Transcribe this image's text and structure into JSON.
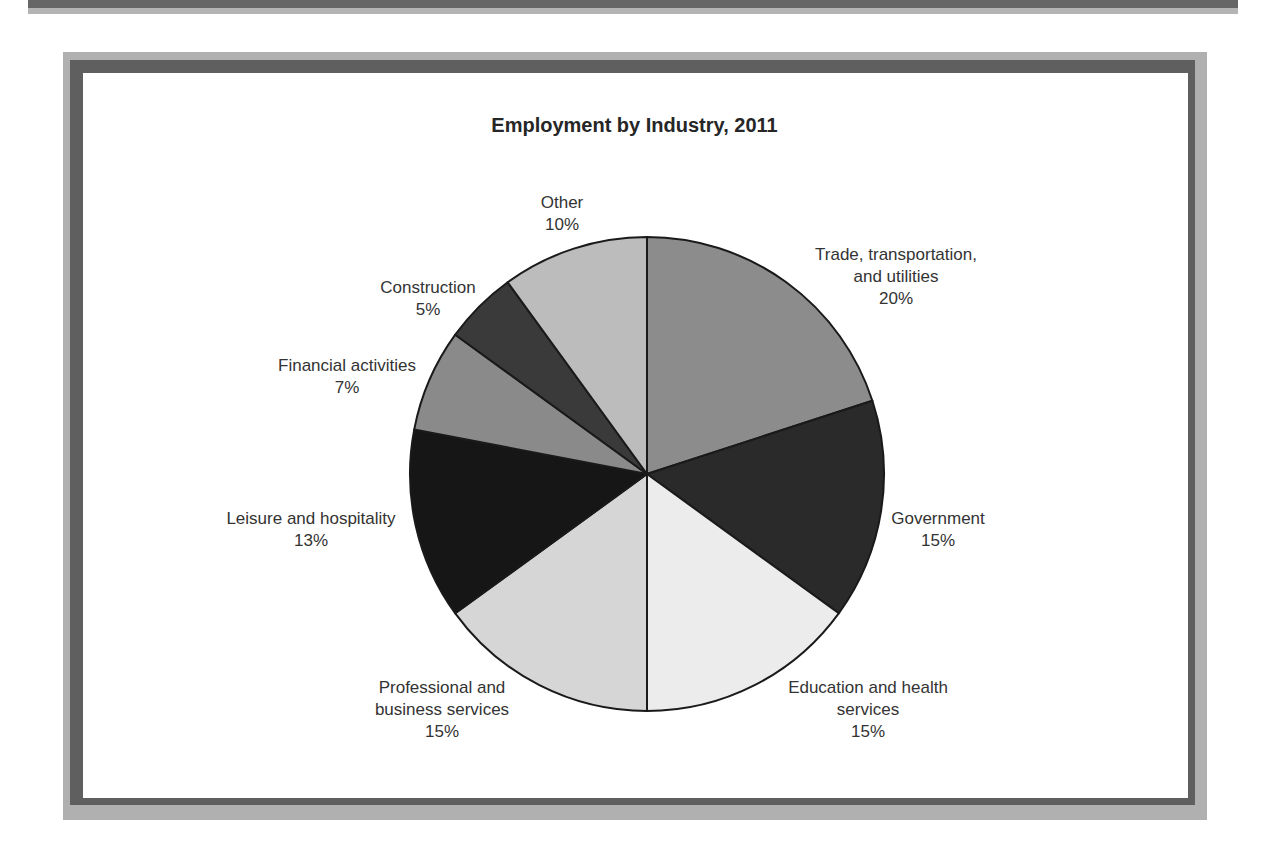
{
  "chart_data": {
    "type": "pie",
    "title": "Employment by Industry, 2011",
    "categories": [
      "Trade, transportation, and utilities",
      "Government",
      "Education and health services",
      "Professional and business services",
      "Leisure and hospitality",
      "Financial activities",
      "Construction",
      "Other"
    ],
    "values": [
      20,
      15,
      15,
      15,
      13,
      7,
      5,
      10
    ],
    "unit": "%",
    "start_angle": "12 o'clock, clockwise",
    "legend": "none (direct labels)"
  },
  "chart": {
    "title": "Employment by Industry, 2011",
    "slices": [
      {
        "label_lines": [
          "Trade, transportation,",
          "and utilities"
        ],
        "pct": "20%",
        "color": "#8c8c8c"
      },
      {
        "label_lines": [
          "Government"
        ],
        "pct": "15%",
        "color": "#2a2a2a"
      },
      {
        "label_lines": [
          "Education and health",
          "services"
        ],
        "pct": "15%",
        "color": "#ececec"
      },
      {
        "label_lines": [
          "Professional and",
          "business services"
        ],
        "pct": "15%",
        "color": "#d6d6d6"
      },
      {
        "label_lines": [
          "Leisure and hospitality"
        ],
        "pct": "13%",
        "color": "#161616"
      },
      {
        "label_lines": [
          "Financial activities"
        ],
        "pct": "7%",
        "color": "#8a8a8a"
      },
      {
        "label_lines": [
          "Construction"
        ],
        "pct": "5%",
        "color": "#3a3a3a"
      },
      {
        "label_lines": [
          "Other"
        ],
        "pct": "10%",
        "color": "#bcbcbc"
      }
    ]
  },
  "colors": {
    "frame_outer": "#b0b0b0",
    "frame_inner": "#5f5f5f",
    "slice_stroke": "#1a1a1a"
  }
}
